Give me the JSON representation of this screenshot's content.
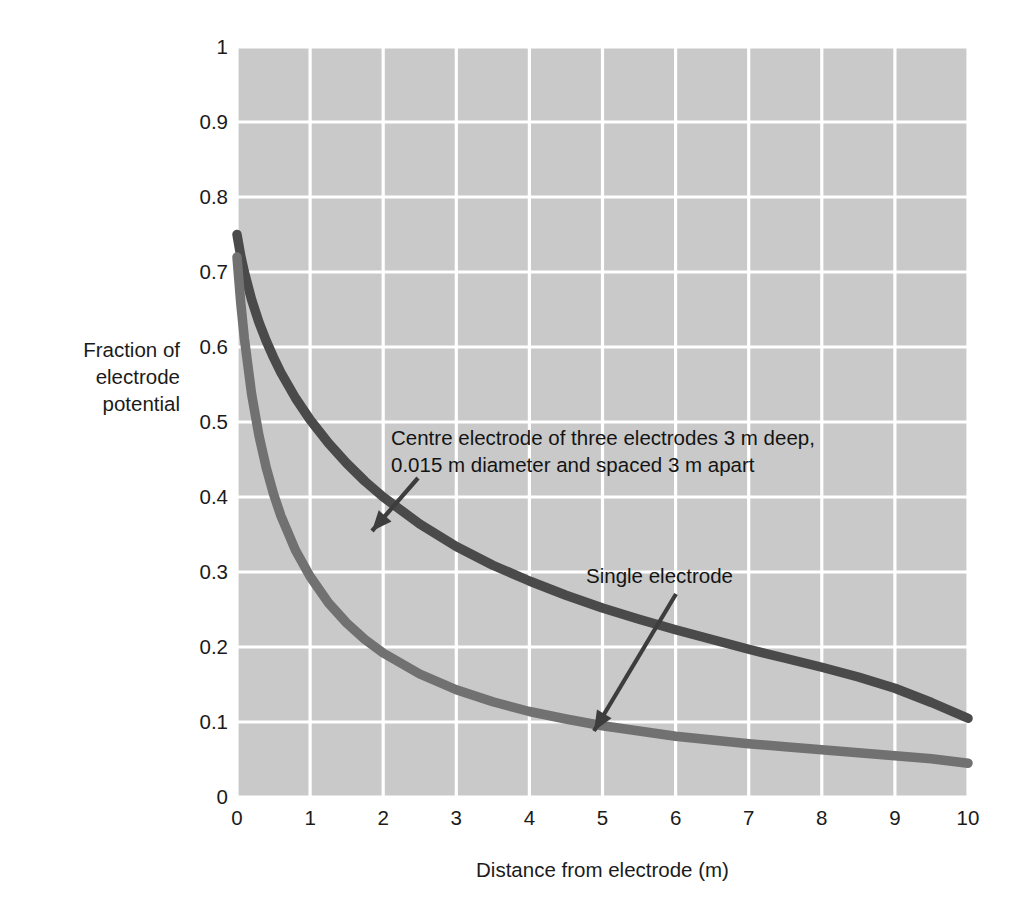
{
  "chart_data": {
    "type": "line",
    "title": "",
    "xlabel": "Distance from electrode (m)",
    "ylabel": "Fraction of\nelectrode\npotential",
    "xlim": [
      0,
      10
    ],
    "ylim": [
      0,
      1
    ],
    "grid": true,
    "legend_position": "inline-annotations",
    "xticks": [
      "0",
      "1",
      "2",
      "3",
      "4",
      "5",
      "6",
      "7",
      "8",
      "9",
      "10"
    ],
    "yticks": [
      "0",
      "0.1",
      "0.2",
      "0.3",
      "0.4",
      "0.5",
      "0.6",
      "0.7",
      "0.8",
      "0.9",
      "1"
    ],
    "plot_background_color": "#c9c9c9",
    "gridline_color": "#ffffff",
    "series": [
      {
        "name": "Centre electrode of three electrodes 3 m deep, 0.015 m diameter and spaced 3 m apart",
        "short_name": "centre-electrode",
        "color": "#4a4a4a",
        "x": [
          0.0,
          0.05,
          0.1,
          0.2,
          0.3,
          0.4,
          0.5,
          0.6,
          0.8,
          1.0,
          1.25,
          1.5,
          1.75,
          2.0,
          2.5,
          3.0,
          3.5,
          4.0,
          4.5,
          5.0,
          5.5,
          6.0,
          6.5,
          7.0,
          7.5,
          8.0,
          8.5,
          9.0,
          9.5,
          10.0
        ],
        "y": [
          0.75,
          0.722,
          0.7,
          0.663,
          0.633,
          0.608,
          0.586,
          0.566,
          0.532,
          0.503,
          0.472,
          0.445,
          0.421,
          0.4,
          0.364,
          0.334,
          0.309,
          0.288,
          0.269,
          0.252,
          0.237,
          0.223,
          0.21,
          0.197,
          0.185,
          0.173,
          0.16,
          0.145,
          0.126,
          0.105
        ]
      },
      {
        "name": "Single electrode",
        "short_name": "single-electrode",
        "color": "#717171",
        "x": [
          0.0,
          0.05,
          0.1,
          0.2,
          0.3,
          0.4,
          0.5,
          0.6,
          0.8,
          1.0,
          1.25,
          1.5,
          1.75,
          2.0,
          2.5,
          3.0,
          3.5,
          4.0,
          4.5,
          5.0,
          5.5,
          6.0,
          6.5,
          7.0,
          7.5,
          8.0,
          8.5,
          9.0,
          9.5,
          10.0
        ],
        "y": [
          0.72,
          0.66,
          0.612,
          0.537,
          0.482,
          0.439,
          0.404,
          0.375,
          0.329,
          0.294,
          0.259,
          0.232,
          0.21,
          0.192,
          0.164,
          0.143,
          0.127,
          0.114,
          0.104,
          0.095,
          0.088,
          0.081,
          0.076,
          0.071,
          0.067,
          0.063,
          0.059,
          0.055,
          0.051,
          0.045
        ]
      }
    ],
    "annotations": [
      {
        "id": "centre-electrode-annotation",
        "text": "Centre electrode of three electrodes 3 m deep,\n0.015 m diameter and spaced 3 m apart",
        "arrow_from": [
          418,
          478
        ],
        "arrow_to": [
          372,
          531
        ]
      },
      {
        "id": "single-electrode-annotation",
        "text": "Single electrode",
        "arrow_from": [
          676,
          594
        ],
        "arrow_to": [
          594,
          731
        ]
      }
    ]
  }
}
